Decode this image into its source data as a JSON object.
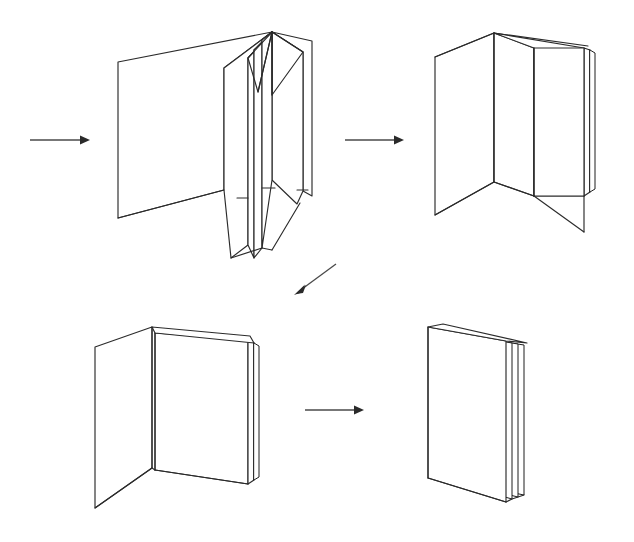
{
  "document": {
    "title": "Paper Folding Instruction Diagram",
    "background_color": "#ffffff",
    "line_color": "#2b2b2b",
    "width": 634,
    "height": 542
  },
  "steps": [
    {
      "id": "step-1",
      "name": "accordion-unfolded-sheet",
      "label": "Accordion folded sheet, panels splayed open",
      "position": {
        "x": 110,
        "y": 25
      },
      "panel_count": 5
    },
    {
      "id": "step-2",
      "name": "three-panel-partially-folded",
      "label": "Panels gathered into three standing sections",
      "position": {
        "x": 425,
        "y": 25
      },
      "panel_count": 3
    },
    {
      "id": "step-3",
      "name": "two-panel-nearly-closed",
      "label": "Folded down to two panels with layered stack",
      "position": {
        "x": 95,
        "y": 310
      },
      "panel_count": 2
    },
    {
      "id": "step-4",
      "name": "closed-booklet",
      "label": "Completely closed multi-leaf booklet",
      "position": {
        "x": 418,
        "y": 318
      },
      "panel_count": 1
    }
  ],
  "arrows": [
    {
      "id": "arrow-1",
      "name": "arrow-start-to-step-1",
      "direction": "right",
      "from": {
        "x": 30,
        "y": 140
      },
      "to": {
        "x": 88,
        "y": 140
      }
    },
    {
      "id": "arrow-2",
      "name": "arrow-step-1-to-step-2",
      "direction": "right",
      "from": {
        "x": 345,
        "y": 140
      },
      "to": {
        "x": 402,
        "y": 140
      }
    },
    {
      "id": "arrow-3",
      "name": "arrow-step-2-to-step-3",
      "direction": "down-left",
      "from": {
        "x": 336,
        "y": 264
      },
      "to": {
        "x": 296,
        "y": 294
      }
    },
    {
      "id": "arrow-4",
      "name": "arrow-step-3-to-step-4",
      "direction": "right",
      "from": {
        "x": 305,
        "y": 410
      },
      "to": {
        "x": 362,
        "y": 410
      }
    }
  ]
}
